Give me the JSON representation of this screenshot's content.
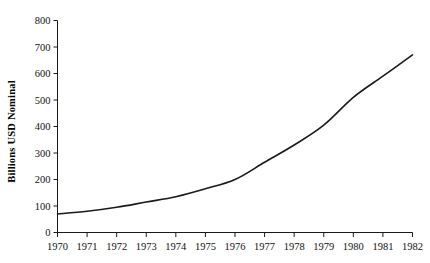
{
  "chart_data": {
    "type": "line",
    "title": "",
    "xlabel": "",
    "ylabel": "Billions USD Nominal",
    "x": [
      1970,
      1971,
      1972,
      1973,
      1974,
      1975,
      1976,
      1977,
      1978,
      1979,
      1980,
      1981,
      1982
    ],
    "categories": [
      "1970",
      "1971",
      "1972",
      "1973",
      "1974",
      "1975",
      "1976",
      "1977",
      "1978",
      "1979",
      "1980",
      "1981",
      "1982"
    ],
    "values": [
      70,
      80,
      95,
      115,
      135,
      165,
      200,
      265,
      330,
      405,
      510,
      590,
      670
    ],
    "series": [
      {
        "name": "Billions USD Nominal",
        "values": [
          70,
          80,
          95,
          115,
          135,
          165,
          200,
          265,
          330,
          405,
          510,
          590,
          670
        ]
      }
    ],
    "xlim": [
      1970,
      1982
    ],
    "ylim": [
      0,
      800
    ],
    "ytick_labels": [
      "0",
      "100",
      "200",
      "300",
      "400",
      "500",
      "600",
      "700",
      "800"
    ],
    "ytick_values": [
      0,
      100,
      200,
      300,
      400,
      500,
      600,
      700,
      800
    ],
    "xtick_labels": [
      "1970",
      "1971",
      "1972",
      "1973",
      "1974",
      "1975",
      "1976",
      "1977",
      "1978",
      "1979",
      "1980",
      "1981",
      "1982"
    ],
    "grid": false,
    "legend": false,
    "legend_position": "none",
    "line_color": "#1a1a1a",
    "line_width": 1.6,
    "background_color": "#ffffff",
    "axis_color": "#1a1a1a"
  }
}
